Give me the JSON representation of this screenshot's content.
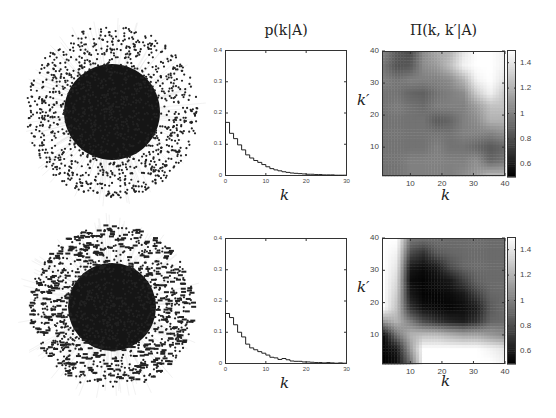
{
  "figure": {
    "rows": [
      {
        "network": {
          "label": "network-graph",
          "style": "dense"
        },
        "hist": {
          "title": "p(k|A)",
          "xlabel": "k"
        },
        "heat": {
          "title": "Π(k, k′|A)",
          "xlabel": "k",
          "ylabel": "k′"
        }
      },
      {
        "network": {
          "label": "network-graph",
          "style": "clustered"
        },
        "hist": {
          "title": "",
          "xlabel": "k"
        },
        "heat": {
          "title": "",
          "xlabel": "k",
          "ylabel": "k′"
        }
      }
    ],
    "hist_yticks": [
      "0",
      "0.1",
      "0.2",
      "0.3",
      "0.4"
    ],
    "hist_xticks": [
      "0",
      "10",
      "20",
      "30"
    ],
    "heat_xticks": [
      "10",
      "20",
      "30",
      "40"
    ],
    "heat_yticks": [
      "10",
      "20",
      "30",
      "40"
    ],
    "colorbar_ticks": [
      "0.6",
      "0.8",
      "1",
      "1.2",
      "1.4"
    ]
  },
  "chart_data": [
    {
      "type": "bar",
      "title": "p(k|A)",
      "xlabel": "k",
      "ylabel": "",
      "xlim": [
        0,
        30
      ],
      "ylim": [
        0,
        0.4
      ],
      "style": "step histogram",
      "categories": [
        0,
        1,
        2,
        3,
        4,
        5,
        6,
        7,
        8,
        9,
        10,
        11,
        12,
        13,
        14,
        15,
        16,
        17,
        18,
        19,
        20,
        21,
        22,
        23,
        24,
        25,
        26,
        27,
        28,
        29
      ],
      "values": [
        0.17,
        0.135,
        0.118,
        0.098,
        0.082,
        0.066,
        0.056,
        0.048,
        0.042,
        0.035,
        0.028,
        0.022,
        0.018,
        0.015,
        0.012,
        0.01,
        0.008,
        0.007,
        0.006,
        0.005,
        0.004,
        0.004,
        0.003,
        0.003,
        0.002,
        0.002,
        0.002,
        0.001,
        0.001,
        0.001
      ]
    },
    {
      "type": "heatmap",
      "title": "Π(k, k′|A)",
      "xlabel": "k",
      "ylabel": "k′",
      "xlim": [
        1,
        40
      ],
      "ylim": [
        1,
        40
      ],
      "colorbar": {
        "range": [
          0.5,
          1.5
        ],
        "ticks": [
          0.6,
          0.8,
          1,
          1.2,
          1.4
        ],
        "colormap": "gray"
      },
      "grid_note": "10x10 coarse grid, rows from k′=40 (top) to k′=1 (bottom), cols k=1..40",
      "values": [
        [
          1.0,
          0.85,
          0.8,
          1.05,
          1.15,
          1.2,
          1.4,
          1.5,
          1.5,
          1.45
        ],
        [
          0.95,
          0.82,
          0.85,
          1.05,
          1.1,
          1.25,
          1.45,
          1.5,
          1.5,
          1.45
        ],
        [
          1.0,
          0.95,
          1.0,
          1.0,
          1.0,
          1.05,
          1.2,
          1.45,
          1.5,
          1.4
        ],
        [
          0.95,
          0.95,
          0.9,
          0.88,
          0.95,
          1.0,
          1.05,
          1.3,
          1.45,
          1.3
        ],
        [
          0.95,
          0.98,
          0.95,
          0.92,
          0.98,
          1.0,
          1.0,
          1.1,
          1.25,
          1.25
        ],
        [
          0.95,
          0.95,
          0.95,
          0.95,
          0.85,
          0.9,
          1.0,
          1.05,
          1.2,
          1.2
        ],
        [
          0.95,
          0.95,
          0.95,
          0.95,
          0.95,
          0.95,
          1.0,
          1.0,
          1.0,
          1.05
        ],
        [
          0.95,
          0.95,
          0.95,
          0.95,
          1.0,
          0.95,
          0.95,
          0.9,
          0.85,
          0.9
        ],
        [
          0.95,
          0.95,
          1.0,
          1.0,
          1.0,
          1.0,
          1.0,
          1.05,
          0.9,
          0.95
        ],
        [
          0.95,
          0.95,
          1.0,
          1.0,
          1.0,
          1.0,
          1.05,
          1.1,
          1.2,
          1.2
        ]
      ]
    },
    {
      "type": "bar",
      "title": "p(k|A)",
      "xlabel": "k",
      "ylabel": "",
      "xlim": [
        0,
        30
      ],
      "ylim": [
        0,
        0.4
      ],
      "style": "step histogram",
      "categories": [
        0,
        1,
        2,
        3,
        4,
        5,
        6,
        7,
        8,
        9,
        10,
        11,
        12,
        13,
        14,
        15,
        16,
        17,
        18,
        19,
        20,
        21,
        22,
        23,
        24,
        25,
        26,
        27,
        28,
        29
      ],
      "values": [
        0.16,
        0.147,
        0.124,
        0.1,
        0.085,
        0.062,
        0.05,
        0.044,
        0.038,
        0.033,
        0.027,
        0.02,
        0.018,
        0.013,
        0.016,
        0.012,
        0.008,
        0.007,
        0.007,
        0.005,
        0.005,
        0.004,
        0.003,
        0.003,
        0.002,
        0.003,
        0.002,
        0.001,
        0.002,
        0.001
      ]
    },
    {
      "type": "heatmap",
      "title": "Π(k, k′|A)",
      "xlabel": "k",
      "ylabel": "k′",
      "xlim": [
        1,
        40
      ],
      "ylim": [
        1,
        40
      ],
      "colorbar": {
        "range": [
          0.5,
          1.5
        ],
        "ticks": [
          0.6,
          0.8,
          1,
          1.2,
          1.4
        ],
        "colormap": "gray"
      },
      "grid_note": "10x10 coarse grid, rows from k′=40 (top) to k′=1 (bottom), cols k=1..40",
      "values": [
        [
          1.5,
          1.5,
          0.95,
          0.92,
          0.92,
          0.92,
          0.92,
          0.92,
          0.92,
          0.92
        ],
        [
          1.5,
          1.45,
          0.8,
          0.7,
          0.85,
          0.9,
          0.92,
          0.92,
          0.92,
          0.92
        ],
        [
          1.5,
          1.4,
          0.6,
          0.55,
          0.6,
          0.8,
          0.9,
          0.92,
          0.92,
          0.92
        ],
        [
          1.5,
          1.35,
          0.55,
          0.52,
          0.55,
          0.6,
          0.75,
          0.88,
          0.92,
          0.92
        ],
        [
          1.5,
          1.3,
          0.6,
          0.52,
          0.52,
          0.55,
          0.6,
          0.75,
          0.9,
          0.92
        ],
        [
          1.5,
          1.25,
          0.7,
          0.55,
          0.52,
          0.52,
          0.55,
          0.6,
          0.85,
          0.92
        ],
        [
          1.1,
          1.2,
          1.0,
          0.8,
          0.7,
          0.65,
          0.62,
          0.7,
          0.9,
          0.92
        ],
        [
          0.55,
          0.95,
          1.2,
          1.25,
          1.25,
          1.2,
          1.15,
          1.15,
          1.1,
          1.05
        ],
        [
          0.52,
          0.6,
          1.1,
          1.5,
          1.5,
          1.5,
          1.5,
          1.5,
          1.45,
          1.4
        ],
        [
          0.5,
          0.55,
          0.95,
          1.5,
          1.5,
          1.5,
          1.5,
          1.5,
          1.5,
          1.45
        ]
      ]
    }
  ]
}
